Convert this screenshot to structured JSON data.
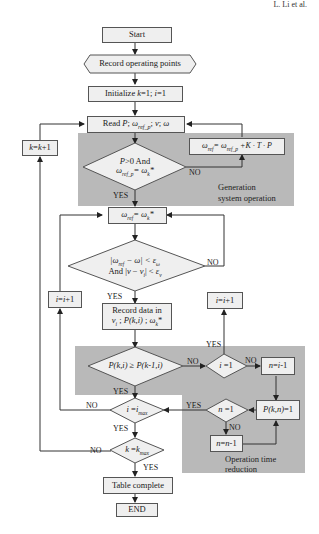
{
  "header": {
    "author_running_head": "L. Li et al."
  },
  "regions": {
    "generation": {
      "label_line1": "Generation",
      "label_line2": "system operation",
      "fill": "#b9b9b9"
    },
    "reduction": {
      "label_line1": "Operation time",
      "label_line2": "reduction",
      "fill": "#b9b9b9"
    }
  },
  "nodes": {
    "start": "Start",
    "record_points": "Record operating points",
    "init": "Initialize k=1; i=1",
    "read": "Read P; ω_ref_p; v; ω",
    "cond_p": {
      "line1": "P>0 And",
      "line2": "ω_ref_p= ω_k*"
    },
    "update_ref": "ω_ref= ω_ref_p +K · T · P",
    "k_inc": "k=k+1",
    "set_ref": "ω_ref= ω_k*",
    "cond_err": {
      "line1": "|ω_ref − ω| < ε_ω",
      "line2": "And |v − v_i| < ε_v"
    },
    "i_inc_left": "i=i+1",
    "i_inc_right": "i=i+1",
    "record_data": {
      "line1": "Record data in",
      "line2": "v_i ; P(k,i) ; ω_k*"
    },
    "cond_pk": "P(k,i) ≥ P(k-1,i)",
    "cond_i1": "i =1",
    "n_set": "n=i-1",
    "cond_imax": "i =i_max",
    "cond_n1": "n =1",
    "p_set": "P(k,n)=1",
    "n_dec": "n=n-1",
    "cond_kmax": "k =k_max",
    "table": "Table complete",
    "end": "END"
  },
  "edge_labels": {
    "yes": "YES",
    "no": "NO"
  }
}
